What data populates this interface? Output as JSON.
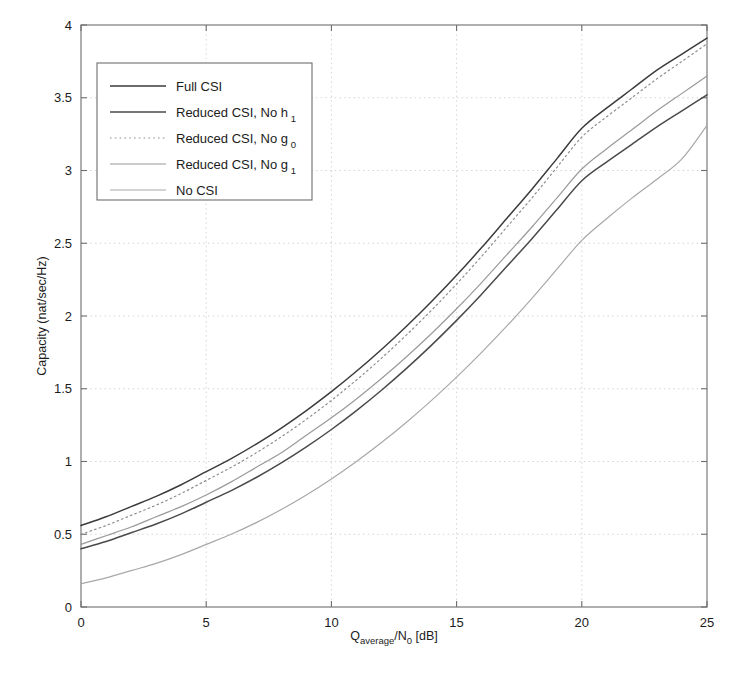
{
  "chart_data": {
    "type": "line",
    "title": "",
    "xlabel": "Q_average/N_0 [dB]",
    "xlabel_parts": {
      "base1": "Q",
      "sub1": "average",
      "mid": "/N",
      "sub2": "0",
      "tail": " [dB]"
    },
    "ylabel": "Capacity (nat/sec/Hz)",
    "xlim": [
      0,
      25
    ],
    "ylim": [
      0,
      4
    ],
    "xticks": [
      0,
      5,
      10,
      15,
      20,
      25
    ],
    "yticks": [
      0,
      0.5,
      1,
      1.5,
      2,
      2.5,
      3,
      3.5,
      4
    ],
    "xticklabels": [
      "0",
      "5",
      "10",
      "15",
      "20",
      "25"
    ],
    "yticklabels": [
      "0",
      "0.5",
      "1",
      "1.5",
      "2",
      "2.5",
      "3",
      "3.5",
      "4"
    ],
    "grid": true,
    "grid_style": "dotted",
    "legend_position": "upper-left",
    "x": [
      0,
      1,
      2,
      3,
      4,
      5,
      6,
      7,
      8,
      9,
      10,
      11,
      12,
      13,
      14,
      15,
      16,
      17,
      18,
      19,
      20,
      21,
      22,
      23,
      24,
      25
    ],
    "series": [
      {
        "name": "Full CSI",
        "label_parts": {
          "text": "Full CSI",
          "sub": ""
        },
        "color": "#3b3b3b",
        "width": 1.5,
        "dash": "none",
        "values": [
          0.56,
          0.62,
          0.69,
          0.76,
          0.84,
          0.93,
          1.02,
          1.12,
          1.23,
          1.35,
          1.48,
          1.62,
          1.77,
          1.93,
          2.1,
          2.28,
          2.47,
          2.67,
          2.87,
          3.08,
          3.29,
          3.43,
          3.56,
          3.69,
          3.8,
          3.91
        ]
      },
      {
        "name": "Reduced CSI, No h_1",
        "label_parts": {
          "text": "Reduced CSI, No h",
          "sub": "1"
        },
        "color": "#4a4a4a",
        "width": 1.5,
        "dash": "none",
        "values": [
          0.4,
          0.45,
          0.51,
          0.57,
          0.64,
          0.72,
          0.8,
          0.89,
          0.99,
          1.1,
          1.22,
          1.35,
          1.49,
          1.64,
          1.8,
          1.97,
          2.15,
          2.34,
          2.53,
          2.73,
          2.93,
          3.06,
          3.18,
          3.3,
          3.41,
          3.52
        ]
      },
      {
        "name": "Reduced CSI, No g_0",
        "label_parts": {
          "text": "Reduced CSI, No g",
          "sub": "0"
        },
        "color": "#8e8e8e",
        "width": 1.2,
        "dash": "dotted",
        "values": [
          0.5,
          0.56,
          0.63,
          0.7,
          0.78,
          0.87,
          0.96,
          1.06,
          1.17,
          1.29,
          1.42,
          1.56,
          1.71,
          1.87,
          2.04,
          2.22,
          2.41,
          2.61,
          2.81,
          3.02,
          3.23,
          3.37,
          3.5,
          3.63,
          3.75,
          3.87
        ]
      },
      {
        "name": "Reduced CSI, No g_1",
        "label_parts": {
          "text": "Reduced CSI, No g",
          "sub": "1"
        },
        "color": "#9a9a9a",
        "width": 1.2,
        "dash": "none",
        "values": [
          0.43,
          0.49,
          0.55,
          0.62,
          0.69,
          0.77,
          0.86,
          0.96,
          1.06,
          1.18,
          1.3,
          1.43,
          1.57,
          1.72,
          1.88,
          2.05,
          2.23,
          2.42,
          2.61,
          2.81,
          3.01,
          3.15,
          3.28,
          3.41,
          3.53,
          3.65
        ]
      },
      {
        "name": "No CSI",
        "label_parts": {
          "text": "No CSI",
          "sub": ""
        },
        "color": "#a8a8a8",
        "width": 1.2,
        "dash": "none",
        "values": [
          0.16,
          0.2,
          0.25,
          0.3,
          0.36,
          0.43,
          0.5,
          0.58,
          0.67,
          0.77,
          0.88,
          1.0,
          1.13,
          1.27,
          1.42,
          1.58,
          1.75,
          1.93,
          2.12,
          2.32,
          2.52,
          2.67,
          2.81,
          2.94,
          3.08,
          3.31
        ]
      }
    ]
  },
  "figure": {
    "background": "#ffffff",
    "frame_color": "#6d6d6d",
    "grid_color": "#c9c9c9"
  }
}
